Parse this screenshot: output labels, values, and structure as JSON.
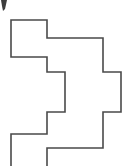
{
  "figure": {
    "title": "orthogonal-polygon-outline",
    "canvas": {
      "width": 134,
      "height": 166,
      "background": "#ffffff"
    },
    "stroke": {
      "color": "#4a4a4a",
      "width": 1.6,
      "style": "solid"
    },
    "fill": "none",
    "vertex_count": 18,
    "points": [
      [
        11,
        20
      ],
      [
        47,
        20
      ],
      [
        47,
        38
      ],
      [
        103,
        38
      ],
      [
        103,
        72
      ],
      [
        121,
        72
      ],
      [
        121,
        112
      ],
      [
        103,
        112
      ],
      [
        103,
        148
      ],
      [
        47,
        148
      ],
      [
        47,
        166
      ],
      [
        47,
        134
      ],
      [
        11,
        134
      ],
      [
        11,
        166
      ],
      [
        11,
        57
      ],
      [
        47,
        57
      ],
      [
        47,
        72
      ],
      [
        65,
        72
      ],
      [
        65,
        112
      ],
      [
        47,
        112
      ]
    ],
    "path_d": "M 11 166 L 11 134 L 47 134 L 47 112 L 65 112 L 65 72 L 47 72 L 47 57 L 11 57 L 11 20 L 47 20 L 47 38 L 103 38 L 103 72 L 121 72 L 121 112 L 103 112 L 103 148 L 47 148 L 47 166",
    "open_ends": [
      {
        "name": "left-bottom-open-end",
        "x": 11,
        "y": 166
      },
      {
        "name": "center-bottom-open-end",
        "x": 47,
        "y": 166
      }
    ],
    "corner_mark": {
      "name": "top-left-speck",
      "x": 1,
      "y": 0,
      "width": 7,
      "height": 11,
      "color": "#3d3d3d",
      "path_d": "M 1 0 L 7 0 L 5 9 L 3 11 L 2 6 Z"
    }
  }
}
